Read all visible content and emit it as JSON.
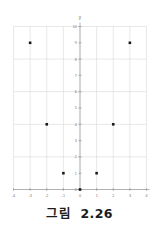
{
  "figure": {
    "caption": "그림  2.26"
  },
  "chart_data": {
    "type": "scatter",
    "title": "",
    "xlabel": "",
    "ylabel": "y",
    "xlim": [
      -4,
      4
    ],
    "ylim": [
      0,
      10
    ],
    "xticks": [
      -4,
      -3,
      -2,
      -1,
      0,
      1,
      2,
      3,
      4
    ],
    "xtick_labels": [
      "-4",
      "-3",
      "-2",
      "-1",
      "0",
      "1",
      "2",
      "3",
      "4"
    ],
    "yticks": [
      0,
      1,
      2,
      3,
      4,
      5,
      6,
      7,
      8,
      9,
      10
    ],
    "ytick_labels": [
      "0",
      "1",
      "2",
      "3",
      "4",
      "5",
      "6",
      "7",
      "8",
      "9",
      "10"
    ],
    "grid": true,
    "legend": "none",
    "series": [
      {
        "name": "points",
        "marker": "square",
        "color": "#1a1a1a",
        "points": [
          {
            "x": -3,
            "y": 9
          },
          {
            "x": -2,
            "y": 4
          },
          {
            "x": -1,
            "y": 1
          },
          {
            "x": 0,
            "y": 0
          },
          {
            "x": 1,
            "y": 1
          },
          {
            "x": 2,
            "y": 4
          },
          {
            "x": 3,
            "y": 9
          }
        ]
      }
    ],
    "colors": {
      "grid": "#d8d8d8",
      "axis": "#9a9a9a",
      "marker": "#1a1a1a",
      "tick_text": "#6e6e6e",
      "background": "#ffffff"
    }
  }
}
